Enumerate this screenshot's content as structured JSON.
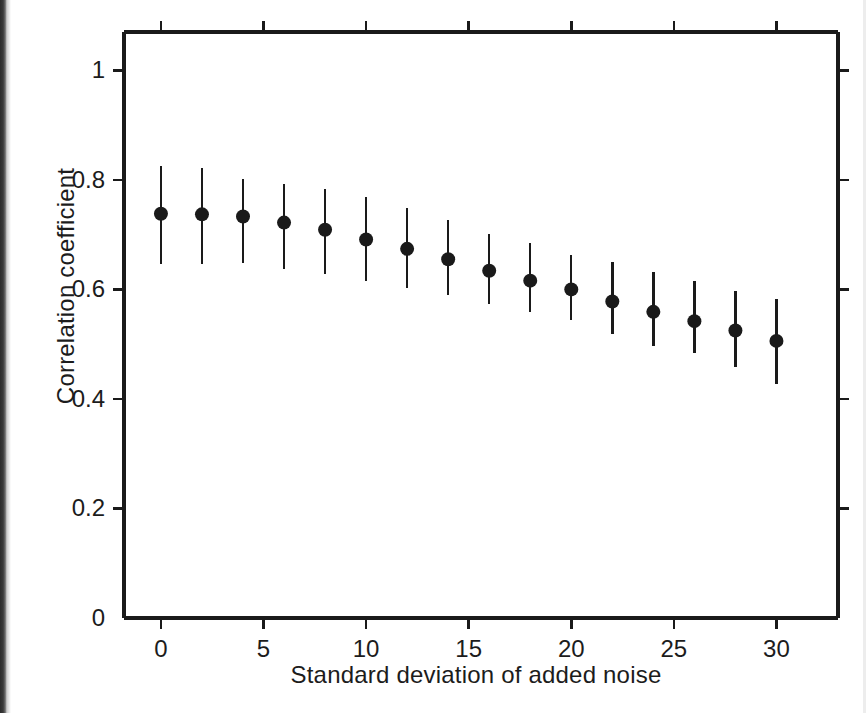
{
  "figure": {
    "background_color": "#ffffff",
    "ink_color": "#1a1a1a",
    "scan_edge_color": "#2b2b2b"
  },
  "axes": {
    "y_title": "Correlation coefficient",
    "x_title": "Standard deviation of added noise",
    "y_ticks": [
      "0",
      "0.2",
      "0.4",
      "0.6",
      "0.8",
      "1"
    ],
    "x_ticks": [
      "0",
      "5",
      "10",
      "15",
      "20",
      "25",
      "30"
    ]
  },
  "chart_data": {
    "type": "scatter",
    "title": "",
    "subtitle": "",
    "xlabel": "Standard deviation of added noise",
    "ylabel": "Correlation coefficient",
    "xlim": [
      -1.8,
      33.0
    ],
    "ylim": [
      0,
      1.07
    ],
    "xticks": [
      0,
      5,
      10,
      15,
      20,
      25,
      30
    ],
    "yticks": [
      0,
      0.2,
      0.4,
      0.6,
      0.8,
      1
    ],
    "grid": false,
    "legend": null,
    "legend_position": "none",
    "marker": "filled-circle",
    "error_bars": "vertical, no caps (1 sd)",
    "tick_direction": "outward",
    "frame": "full box (all four spines, ticks on all four spines)",
    "x": [
      0,
      2,
      4,
      6,
      8,
      10,
      12,
      14,
      16,
      18,
      20,
      22,
      24,
      26,
      28,
      30
    ],
    "values": [
      0.738,
      0.737,
      0.733,
      0.722,
      0.709,
      0.691,
      0.674,
      0.655,
      0.634,
      0.616,
      0.6,
      0.578,
      0.559,
      0.542,
      0.525,
      0.506
    ],
    "error_low": [
      0.646,
      0.647,
      0.648,
      0.638,
      0.629,
      0.616,
      0.603,
      0.589,
      0.573,
      0.558,
      0.544,
      0.519,
      0.497,
      0.483,
      0.458,
      0.428
    ],
    "error_high": [
      0.825,
      0.822,
      0.802,
      0.793,
      0.784,
      0.768,
      0.748,
      0.726,
      0.702,
      0.684,
      0.663,
      0.65,
      0.632,
      0.615,
      0.597,
      0.583
    ],
    "series": [
      {
        "name": "Correlation coefficient vs added noise",
        "x": [
          0,
          2,
          4,
          6,
          8,
          10,
          12,
          14,
          16,
          18,
          20,
          22,
          24,
          26,
          28,
          30
        ],
        "values": [
          0.738,
          0.737,
          0.733,
          0.722,
          0.709,
          0.691,
          0.674,
          0.655,
          0.634,
          0.616,
          0.6,
          0.578,
          0.559,
          0.542,
          0.525,
          0.506
        ]
      }
    ]
  }
}
